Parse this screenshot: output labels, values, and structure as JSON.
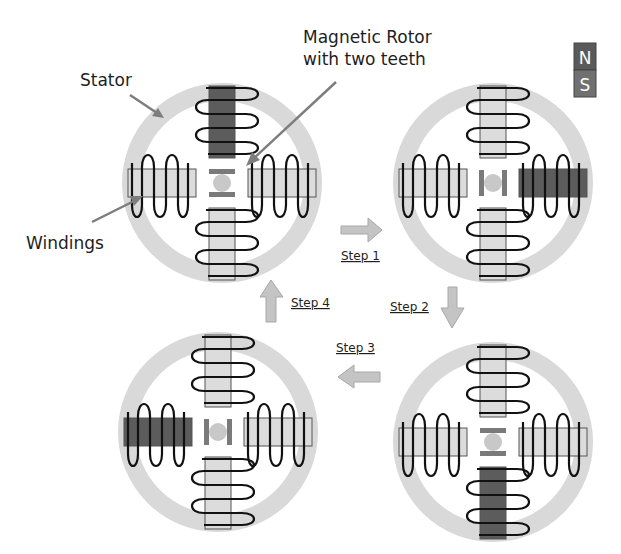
{
  "labels": {
    "stator": "Stator",
    "rotor_line1": "Magnetic Rotor",
    "rotor_line2": "with two teeth",
    "windings": "Windings"
  },
  "legend": {
    "north": "N",
    "south": "S",
    "north_color": "#5a5a5a",
    "south_color": "#707070"
  },
  "colors": {
    "stator_ring": "#d9d9d9",
    "pole_off": "#dcdcdc",
    "pole_on": "#5c5c5c",
    "rotor_body": "#c8c8c8",
    "rotor_teeth": "#7a7a7a",
    "arrow_fill": "#c4c4c4",
    "arrow_stroke": "#a8a8a8",
    "pointer": "#7d7d7d",
    "wire": "#111111"
  },
  "steps": [
    {
      "label": "Step 1",
      "direction": "right"
    },
    {
      "label": "Step 2",
      "direction": "down"
    },
    {
      "label": "Step 3",
      "direction": "left"
    },
    {
      "label": "Step 4",
      "direction": "up"
    }
  ],
  "motors": [
    {
      "name": "initial",
      "position": "top-left",
      "energized_pole": "top",
      "rotor_orientation": "vertical"
    },
    {
      "name": "after-step-1",
      "position": "top-right",
      "energized_pole": "right",
      "rotor_orientation": "horizontal"
    },
    {
      "name": "after-step-2",
      "position": "bottom-right",
      "energized_pole": "bottom",
      "rotor_orientation": "vertical"
    },
    {
      "name": "after-step-3",
      "position": "bottom-left",
      "energized_pole": "left",
      "rotor_orientation": "horizontal"
    }
  ]
}
